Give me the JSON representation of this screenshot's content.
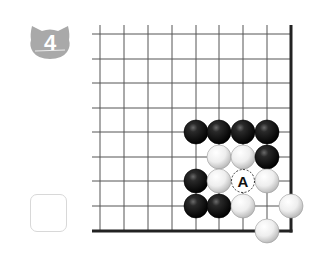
{
  "problem": {
    "number": "4",
    "badge_color": "#a9a9a9"
  },
  "answer_box": {
    "checked": false
  },
  "board": {
    "grid_color": "#555555",
    "edge_color": "#222222",
    "columns_x": [
      100,
      124,
      148,
      172,
      196,
      219,
      243,
      267,
      291
    ],
    "rows_y": [
      34,
      59,
      83,
      108,
      132,
      157,
      181,
      206,
      231
    ],
    "edges": [
      "right",
      "bottom"
    ],
    "stones": [
      {
        "color": "black",
        "col": 4,
        "row": 4
      },
      {
        "color": "black",
        "col": 5,
        "row": 4
      },
      {
        "color": "black",
        "col": 6,
        "row": 4
      },
      {
        "color": "black",
        "col": 7,
        "row": 4
      },
      {
        "color": "white",
        "col": 5,
        "row": 5
      },
      {
        "color": "white",
        "col": 6,
        "row": 5
      },
      {
        "color": "black",
        "col": 7,
        "row": 5
      },
      {
        "color": "black",
        "col": 4,
        "row": 6
      },
      {
        "color": "white",
        "col": 5,
        "row": 6
      },
      {
        "color": "white",
        "col": 7,
        "row": 6
      },
      {
        "color": "black",
        "col": 4,
        "row": 7
      },
      {
        "color": "black",
        "col": 5,
        "row": 7
      },
      {
        "color": "white",
        "col": 6,
        "row": 7
      },
      {
        "color": "white",
        "col": 8,
        "row": 7
      },
      {
        "color": "white",
        "col": 7,
        "row": 8
      }
    ],
    "markers": [
      {
        "label": "A",
        "col": 6,
        "row": 6,
        "style": "dashed-circle"
      }
    ]
  }
}
